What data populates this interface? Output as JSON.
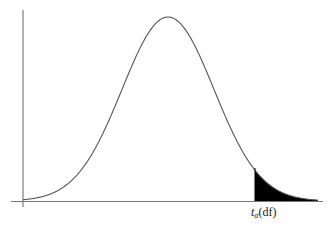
{
  "figure": {
    "critical_value_label": {
      "symbol": "t",
      "subscript": "α",
      "argument": "(df)"
    },
    "colors": {
      "curve": "#555555",
      "axes": "#666666",
      "shaded_tail": "#000000",
      "background": "#ffffff"
    }
  }
}
